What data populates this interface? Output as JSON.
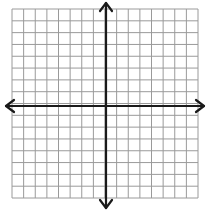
{
  "diagram": {
    "type": "coordinate-grid",
    "grid": {
      "columns": 16,
      "rows": 16,
      "left": 12,
      "top": 9,
      "right": 198,
      "bottom": 198,
      "line_color": "#9a9a9a"
    },
    "axes": {
      "x_axis_y": 106,
      "y_axis_x": 106,
      "color": "#1a1a1a",
      "arrows": [
        "left",
        "right",
        "up",
        "down"
      ]
    },
    "labels": []
  }
}
